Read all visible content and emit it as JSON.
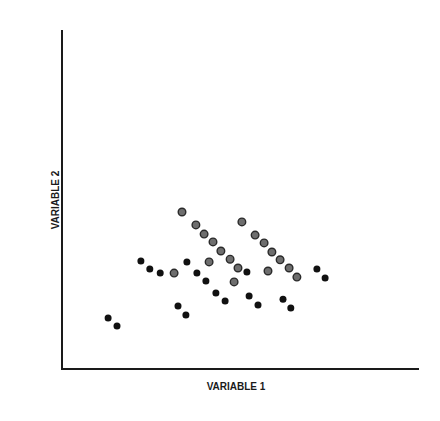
{
  "chart_data": {
    "type": "scatter",
    "title": "",
    "xlabel": "VARIABLE 1",
    "ylabel": "VARIABLE 2",
    "xlim": [
      0,
      100
    ],
    "ylim": [
      0,
      100
    ],
    "grid": false,
    "legend": "none",
    "x_ticks": [],
    "y_ticks": [],
    "series": [
      {
        "name": "gray points",
        "color": "#6e6e6e",
        "points": [
          [
            33.6,
            46.3
          ],
          [
            37.5,
            42.5
          ],
          [
            39.8,
            39.8
          ],
          [
            42.3,
            37.5
          ],
          [
            44.5,
            34.8
          ],
          [
            47.1,
            32.4
          ],
          [
            49.3,
            29.8
          ],
          [
            41.2,
            31.6
          ],
          [
            31.4,
            28.3
          ],
          [
            48.2,
            25.7
          ],
          [
            50.4,
            43.4
          ],
          [
            54.1,
            39.5
          ],
          [
            56.6,
            37.2
          ],
          [
            58.8,
            34.5
          ],
          [
            61.1,
            32.2
          ],
          [
            63.6,
            29.8
          ],
          [
            65.8,
            27.1
          ],
          [
            57.7,
            28.9
          ]
        ]
      },
      {
        "name": "black points",
        "color": "#111111",
        "points": [
          [
            22.1,
            31.9
          ],
          [
            24.6,
            29.5
          ],
          [
            27.5,
            28.3
          ],
          [
            35.0,
            31.6
          ],
          [
            37.8,
            28.3
          ],
          [
            40.3,
            26.0
          ],
          [
            43.1,
            22.4
          ],
          [
            45.7,
            20.1
          ],
          [
            51.8,
            28.6
          ],
          [
            52.4,
            21.5
          ],
          [
            54.9,
            18.9
          ],
          [
            61.9,
            20.6
          ],
          [
            64.1,
            18.0
          ],
          [
            71.4,
            29.5
          ],
          [
            73.7,
            26.8
          ],
          [
            32.5,
            18.6
          ],
          [
            34.7,
            15.9
          ],
          [
            12.9,
            15.0
          ],
          [
            15.4,
            12.7
          ]
        ]
      }
    ]
  }
}
